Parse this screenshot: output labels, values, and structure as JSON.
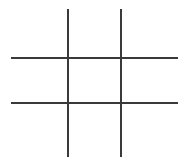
{
  "game": {
    "type": "tic-tac-toe",
    "line_color": "#3a3a3a",
    "cells": [
      "",
      "",
      "",
      "",
      "",
      "",
      "",
      "",
      ""
    ]
  }
}
